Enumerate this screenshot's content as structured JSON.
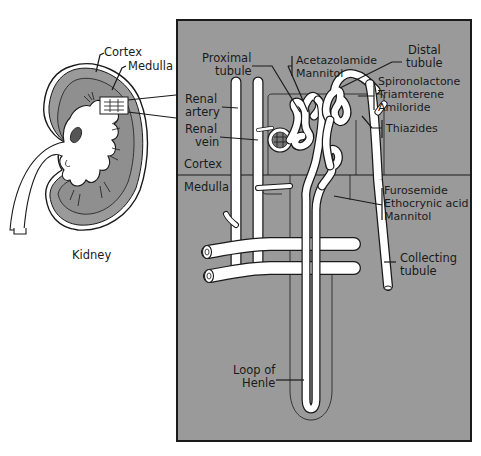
{
  "diagram": {
    "colors": {
      "panel_fill": "#9a9a9a",
      "panel_border": "#1a1a1a",
      "kidney_medulla": "#8f8f8f",
      "tube_fill": "#ffffff",
      "outline": "#1a1a1a",
      "background": "#ffffff"
    },
    "kidney_inset": {
      "caption": "Kidney",
      "labels": {
        "cortex": "Cortex",
        "medulla": "Medulla"
      }
    },
    "nephron_panel": {
      "region_labels": {
        "cortex": "Cortex",
        "medulla": "Medulla"
      },
      "structure_labels": {
        "proximal_tubule_line1": "Proximal",
        "proximal_tubule_line2": "tubule",
        "renal_artery_line1": "Renal",
        "renal_artery_line2": "artery",
        "renal_vein_line1": "Renal",
        "renal_vein_line2": "vein",
        "distal_tubule_line1": "Distal",
        "distal_tubule_line2": "tubule",
        "collecting_tubule_line1": "Collecting",
        "collecting_tubule_line2": "tubule",
        "loop_of_henle_line1": "Loop of",
        "loop_of_henle_line2": "Henle"
      },
      "drug_groups": [
        {
          "site": "proximal tubule",
          "drugs": [
            "Acetazolamide",
            "Mannitol"
          ]
        },
        {
          "site": "distal tubule / collecting",
          "drugs": [
            "Spironolactone",
            "Triamterene",
            "Amiloride"
          ]
        },
        {
          "site": "distal tubule",
          "drugs": [
            "Thiazides"
          ]
        },
        {
          "site": "loop of Henle",
          "drugs": [
            "Furosemide",
            "Ethocrynic acid",
            "Mannitol"
          ]
        }
      ]
    }
  }
}
